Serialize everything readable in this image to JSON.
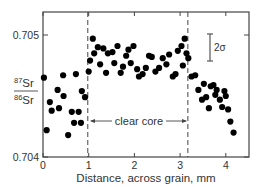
{
  "chart_data": {
    "type": "scatter",
    "title": "",
    "xlabel": "Distance, across grain, mm",
    "ylabel_numerator": "87Sr",
    "ylabel_denominator": "86Sr",
    "ylabel": "87Sr/86Sr",
    "xlim": [
      0,
      4.5
    ],
    "ylim": [
      0.704,
      0.7052
    ],
    "x_ticks": [
      "0",
      "1",
      "2",
      "3",
      "4"
    ],
    "y_ticks": [
      "0.704",
      "0.705"
    ],
    "grid": false,
    "annotations": {
      "dashed_lines_x": [
        0.98,
        3.17
      ],
      "region_label": "clear core",
      "error_bar_label": "2σ",
      "error_bar_halfwidth": 0.00012
    },
    "points": [
      [
        0.02,
        0.70465
      ],
      [
        0.08,
        0.70422
      ],
      [
        0.15,
        0.70445
      ],
      [
        0.19,
        0.70438
      ],
      [
        0.32,
        0.70455
      ],
      [
        0.35,
        0.7044
      ],
      [
        0.45,
        0.7045
      ],
      [
        0.44,
        0.70467
      ],
      [
        0.55,
        0.70418
      ],
      [
        0.63,
        0.70437
      ],
      [
        0.68,
        0.70428
      ],
      [
        0.72,
        0.70468
      ],
      [
        0.78,
        0.70437
      ],
      [
        0.83,
        0.70428
      ],
      [
        0.85,
        0.70454
      ],
      [
        0.92,
        0.70449
      ],
      [
        1.0,
        0.7047
      ],
      [
        1.03,
        0.70479
      ],
      [
        1.09,
        0.70497
      ],
      [
        1.12,
        0.70485
      ],
      [
        1.2,
        0.7049
      ],
      [
        1.25,
        0.70476
      ],
      [
        1.32,
        0.70489
      ],
      [
        1.38,
        0.70469
      ],
      [
        1.42,
        0.70485
      ],
      [
        1.52,
        0.70486
      ],
      [
        1.56,
        0.70477
      ],
      [
        1.63,
        0.70491
      ],
      [
        1.7,
        0.70469
      ],
      [
        1.75,
        0.70474
      ],
      [
        1.82,
        0.70483
      ],
      [
        1.87,
        0.70488
      ],
      [
        1.92,
        0.70477
      ],
      [
        1.98,
        0.70491
      ],
      [
        2.06,
        0.70472
      ],
      [
        2.1,
        0.70466
      ],
      [
        2.18,
        0.70468
      ],
      [
        2.25,
        0.70473
      ],
      [
        2.32,
        0.70483
      ],
      [
        2.38,
        0.70482
      ],
      [
        2.46,
        0.7047
      ],
      [
        2.54,
        0.70473
      ],
      [
        2.62,
        0.70481
      ],
      [
        2.7,
        0.70476
      ],
      [
        2.76,
        0.70484
      ],
      [
        2.84,
        0.70466
      ],
      [
        2.9,
        0.70468
      ],
      [
        2.95,
        0.70487
      ],
      [
        3.03,
        0.70491
      ],
      [
        3.1,
        0.70497
      ],
      [
        3.06,
        0.70475
      ],
      [
        3.14,
        0.70485
      ],
      [
        3.18,
        0.70481
      ],
      [
        3.25,
        0.70466
      ],
      [
        3.33,
        0.70467
      ],
      [
        3.4,
        0.70455
      ],
      [
        3.48,
        0.70447
      ],
      [
        3.52,
        0.7046
      ],
      [
        3.57,
        0.70449
      ],
      [
        3.63,
        0.7044
      ],
      [
        3.67,
        0.70458
      ],
      [
        3.73,
        0.70459
      ],
      [
        3.77,
        0.70451
      ],
      [
        3.8,
        0.70455
      ],
      [
        3.87,
        0.70447
      ],
      [
        3.92,
        0.70441
      ],
      [
        3.97,
        0.70454
      ],
      [
        4.0,
        0.7045
      ],
      [
        4.05,
        0.70439
      ],
      [
        4.1,
        0.70429
      ],
      [
        4.17,
        0.7042
      ]
    ]
  }
}
